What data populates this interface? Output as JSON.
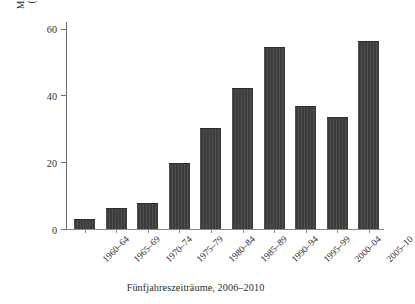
{
  "chart_data": {
    "type": "bar",
    "title": "",
    "subtitle": "",
    "xlabel": "Fünfjahreszeiträume, 2006–2010",
    "ylabel": "Mittlere Entwicklungshilfe pro Kopf (US-Dollar) für Subsahara-Afrika",
    "ylabel_lines": [
      "Mittlere Entwicklungshilfe pro Kopf",
      "(US-Dollar) für Subsahara-Afrika"
    ],
    "categories": [
      "1960–64",
      "1965–69",
      "1970–74",
      "1975–79",
      "1980–84",
      "1985–89",
      "1990–94",
      "1995–99",
      "2000–04",
      "2005–10"
    ],
    "values": [
      2.6,
      6.0,
      7.6,
      19.4,
      30.0,
      41.8,
      54.2,
      36.4,
      33.4,
      56.0
    ],
    "ylim": [
      0,
      62
    ],
    "yticks": [
      0,
      20,
      40,
      60
    ],
    "ytick_labels": [
      "0",
      "20",
      "40",
      "60"
    ],
    "grid": false,
    "legend": "none",
    "bar_color": "#3c3c3c",
    "axis_color": "#6d6d6d",
    "background_color": "#ffffff"
  }
}
